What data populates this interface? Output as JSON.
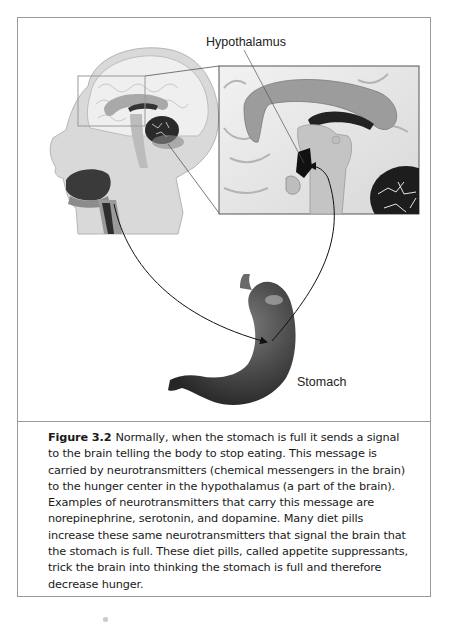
{
  "figure": {
    "labels": {
      "hypothalamus": "Hypothalamus",
      "stomach": "Stomach"
    },
    "illustration": {
      "head": "sagittal-head-brain-illustration",
      "inset": "magnified-hypothalamus-inset",
      "organ": "stomach-illustration",
      "arrows": [
        "brain-to-stomach-arrow",
        "stomach-to-hypothalamus-arrow"
      ]
    },
    "caption": {
      "figure_label": "Figure 3.2",
      "lines": [
        "Normally, when the stomach is full it sends a signal",
        "to the brain telling the body to stop eating. This message is",
        "carried by neurotransmitters (chemical messengers in the brain)",
        "to the hunger center in the hypothalamus (a part of the brain).",
        "Examples of neurotransmitters that carry this message are",
        "norepinephrine, serotonin, and dopamine. Many diet pills",
        "increase these same neurotransmitters that signal the brain that",
        "the stomach is full. These diet pills, called appetite suppressants,",
        "trick the brain into thinking the stomach is full and therefore",
        "decrease hunger."
      ]
    }
  }
}
